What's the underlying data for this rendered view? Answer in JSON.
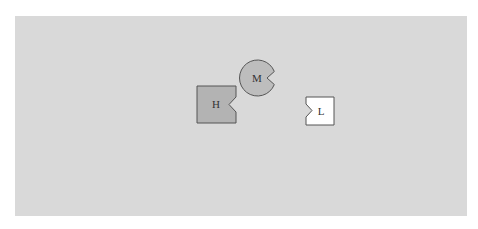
{
  "diagram": {
    "background_color": "#d9d9d9",
    "shapes": [
      {
        "id": "H",
        "label": "H",
        "shape": "square-with-right-notch",
        "fill": "#b3b3b3",
        "stroke": "#555555"
      },
      {
        "id": "M",
        "label": "M",
        "shape": "circle-with-right-notch",
        "fill": "#bdbdbd",
        "stroke": "#555555"
      },
      {
        "id": "L",
        "label": "L",
        "shape": "square-with-left-notch",
        "fill": "#ffffff",
        "stroke": "#555555"
      }
    ]
  }
}
